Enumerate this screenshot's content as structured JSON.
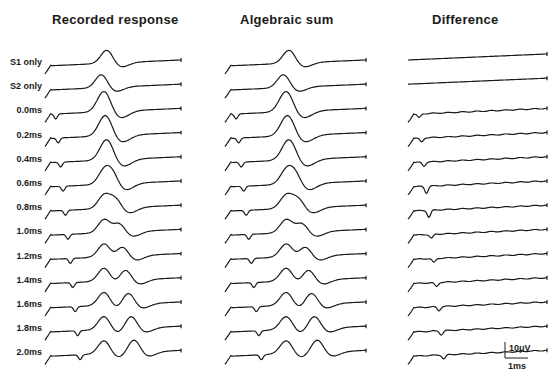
{
  "figure": {
    "panels": [
      {
        "id": "recorded",
        "title": "Recorded response",
        "x": 45,
        "width": 135
      },
      {
        "id": "algebraic",
        "title": "Algebraic sum",
        "x": 225,
        "width": 140
      },
      {
        "id": "difference",
        "title": "Difference",
        "x": 408,
        "width": 138
      }
    ],
    "row_labels": [
      "S1 only",
      "S2 only",
      "0.0ms",
      "0.2ms",
      "0.4ms",
      "0.6ms",
      "0.8ms",
      "1.0ms",
      "1.2ms",
      "1.4ms",
      "1.6ms",
      "1.8ms",
      "2.0ms"
    ],
    "scale_bar": {
      "vertical": "10μV",
      "horizontal": "1ms"
    },
    "caption_fragment": "... of the ... and ... of the ... (D) ..."
  }
}
